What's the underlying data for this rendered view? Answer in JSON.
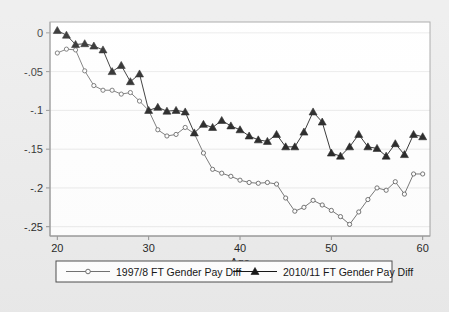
{
  "chart_data": {
    "type": "line",
    "title": "",
    "xlabel": "Age",
    "ylabel": "",
    "xlim": [
      19.2,
      60.8
    ],
    "ylim": [
      -0.262,
      0.014
    ],
    "xticks": [
      20,
      30,
      40,
      50,
      60
    ],
    "xtick_labels": [
      "20",
      "30",
      "40",
      "50",
      "60"
    ],
    "yticks": [
      0,
      -0.05,
      -0.1,
      -0.15,
      -0.2,
      -0.25
    ],
    "ytick_labels": [
      "0",
      "-.05",
      "-.1",
      "-.15",
      "-.2",
      "-.25"
    ],
    "grid": "horizontal",
    "legend_position": "below-axis",
    "x": [
      20,
      21,
      22,
      23,
      24,
      25,
      26,
      27,
      28,
      29,
      30,
      31,
      32,
      33,
      34,
      35,
      36,
      37,
      38,
      39,
      40,
      41,
      42,
      43,
      44,
      45,
      46,
      47,
      48,
      49,
      50,
      51,
      52,
      53,
      54,
      55,
      56,
      57,
      58,
      59,
      60
    ],
    "series": [
      {
        "name": "1997/8 FT Gender Pay Diff",
        "marker": "circle-open",
        "color": "#6e6e6e",
        "values": [
          -0.026,
          -0.021,
          -0.022,
          -0.049,
          -0.068,
          -0.074,
          -0.074,
          -0.079,
          -0.077,
          -0.088,
          -0.1,
          -0.125,
          -0.133,
          -0.131,
          -0.122,
          -0.13,
          -0.155,
          -0.176,
          -0.181,
          -0.185,
          -0.19,
          -0.193,
          -0.194,
          -0.193,
          -0.195,
          -0.213,
          -0.23,
          -0.225,
          -0.216,
          -0.222,
          -0.229,
          -0.237,
          -0.247,
          -0.231,
          -0.215,
          -0.2,
          -0.203,
          -0.192,
          -0.208,
          -0.182,
          -0.182
        ]
      },
      {
        "name": "2010/11 FT Gender Pay Diff",
        "marker": "triangle-filled",
        "color": "#111111",
        "values": [
          0.003,
          -0.003,
          -0.015,
          -0.014,
          -0.017,
          -0.022,
          -0.05,
          -0.042,
          -0.063,
          -0.053,
          -0.1,
          -0.096,
          -0.101,
          -0.1,
          -0.102,
          -0.129,
          -0.118,
          -0.122,
          -0.113,
          -0.12,
          -0.125,
          -0.133,
          -0.138,
          -0.14,
          -0.131,
          -0.147,
          -0.147,
          -0.128,
          -0.102,
          -0.115,
          -0.155,
          -0.159,
          -0.147,
          -0.131,
          -0.147,
          -0.149,
          -0.159,
          -0.143,
          -0.157,
          -0.131,
          -0.134
        ]
      }
    ]
  },
  "legend": {
    "entries": [
      {
        "label": "1997/8 FT Gender Pay Diff",
        "marker": "circle-open"
      },
      {
        "label": "2010/11 FT Gender Pay Diff",
        "marker": "triangle-filled"
      }
    ]
  },
  "colors": {
    "page_background": "#ebebeb",
    "plot_background": "#ffffff",
    "series_a": "#6e6e6e",
    "series_b": "#111111",
    "axis": "#8c8c8c",
    "grid": "#e2e2e2"
  }
}
